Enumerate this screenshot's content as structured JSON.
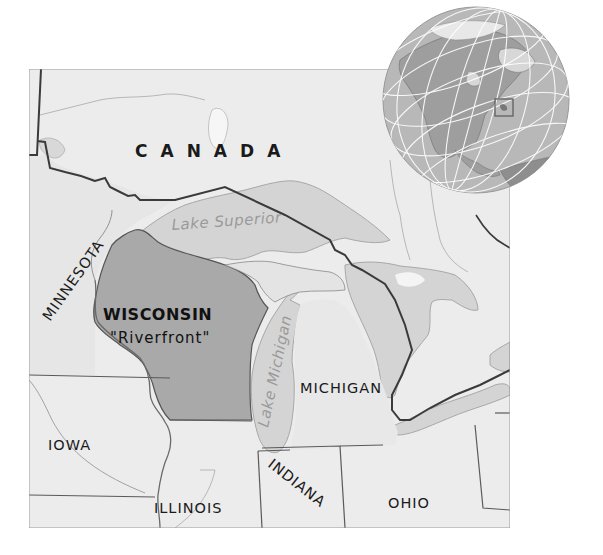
{
  "map": {
    "title": "Wisconsin \"Riverfront\" locator map",
    "colors": {
      "land": "#ececec",
      "water": "#d4d4d4",
      "highlight_state": "#a9a9a9",
      "state_border": "#555555",
      "country_border": "#3a3a3a",
      "lake_text": "#9a9a9a",
      "globe_ocean": "#b8b8b8",
      "globe_land": "#9e9e9e",
      "globe_graticule": "#ffffff",
      "frame": "#9a9a9a"
    },
    "labels": {
      "country": "CANADA",
      "highlight_state": "WISCONSIN",
      "highlight_subtitle": "\"Riverfront\"",
      "states": {
        "minnesota": "MINNESOTA",
        "iowa": "IOWA",
        "illinois": "ILLINOIS",
        "indiana": "INDIANA",
        "michigan": "MICHIGAN",
        "ohio": "OHIO"
      },
      "lakes": {
        "superior": "Lake Superior",
        "michigan": "Lake Michigan"
      }
    },
    "inset_globe": {
      "region": "North America",
      "locator_box": "Wisconsin area highlighted"
    }
  }
}
